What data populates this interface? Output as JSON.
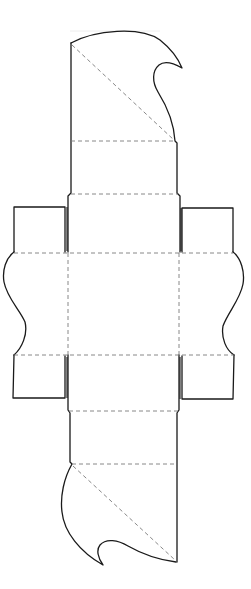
{
  "diagram": {
    "kind": "papercraft box die-line template",
    "colors": {
      "background": "#ffffff",
      "cut_line": "#1a1a1a",
      "fold_line": "#7a7a7a"
    },
    "legend": {
      "cut": "solid line = cut",
      "fold": "dashed line = fold"
    },
    "panels": [
      {
        "id": "top-lid-flap",
        "label": "top lid flap with curl"
      },
      {
        "id": "top-strip",
        "label": "upper side panel"
      },
      {
        "id": "top-neck",
        "label": "upper tuck panel"
      },
      {
        "id": "center-base",
        "label": "base square"
      },
      {
        "id": "left-wave",
        "label": "left wavy side panel"
      },
      {
        "id": "right-wave",
        "label": "right wavy side panel"
      },
      {
        "id": "left-top-tab",
        "label": "left upper glue tab"
      },
      {
        "id": "left-bottom-tab",
        "label": "left lower glue tab"
      },
      {
        "id": "right-top-tab",
        "label": "right upper glue tab"
      },
      {
        "id": "right-bottom-tab",
        "label": "right lower glue tab"
      },
      {
        "id": "bottom-neck",
        "label": "lower tuck panel"
      },
      {
        "id": "bottom-strip",
        "label": "lower side panel"
      },
      {
        "id": "bottom-lid-flap",
        "label": "bottom lid flap with curl"
      }
    ]
  }
}
